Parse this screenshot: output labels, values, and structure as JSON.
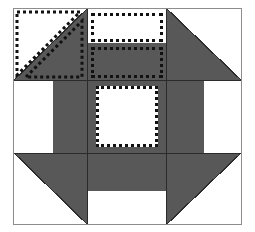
{
  "figure": {
    "canvas": {
      "width": 255,
      "height": 232
    },
    "background_color": "#ffffff"
  },
  "colors": {
    "fabric_dark": "#585858",
    "fabric_light": "#ffffff",
    "seam_line": "#2b2b2b",
    "frame_border": "#8d8d8d",
    "annotation_dotted": "#111111"
  },
  "block": {
    "frame": {
      "x": 13,
      "y": 8,
      "width": 229,
      "height": 217
    },
    "columns": [
      {
        "name": "left",
        "x": 0,
        "width": 73
      },
      {
        "name": "center",
        "x": 73,
        "width": 80
      },
      {
        "name": "right",
        "x": 153,
        "width": 74
      }
    ],
    "rows": [
      {
        "name": "top",
        "y": 0,
        "height": 71
      },
      {
        "name": "middle",
        "y": 71,
        "height": 73
      },
      {
        "name": "bottom",
        "y": 144,
        "height": 71
      }
    ]
  },
  "patches": [
    {
      "id": "top-left",
      "label": "Half-square triangle, light upper-left / dark lower-right",
      "shape": "half-square-triangle",
      "orientation": "tl-light",
      "x": 0,
      "y": 0,
      "width": 73,
      "height": 71
    },
    {
      "id": "top-center",
      "label": "Split rectangle, light top / dark bottom",
      "shape": "split-rectangle",
      "x": 73,
      "y": 0,
      "width": 80,
      "height": 71,
      "split_y": 34,
      "top_fill": "light",
      "bottom_fill": "dark"
    },
    {
      "id": "top-right",
      "label": "Half-square triangle, dark lower-left / light upper-right",
      "shape": "half-square-triangle",
      "orientation": "tr-light",
      "x": 153,
      "y": 0,
      "width": 74,
      "height": 71
    },
    {
      "id": "middle-left",
      "label": "Rectangle bar, light left / dark right",
      "shape": "split-rectangle-vertical",
      "x": 0,
      "y": 71,
      "width": 73,
      "height": 73,
      "split_x": 39,
      "left_fill": "light",
      "right_fill": "dark"
    },
    {
      "id": "center",
      "label": "Center square, light on dark ground",
      "shape": "square-on-ground",
      "x": 73,
      "y": 71,
      "width": 80,
      "height": 73,
      "inner": {
        "x": 9,
        "y": 6,
        "width": 62,
        "height": 61
      },
      "ground_fill": "dark",
      "inner_fill": "light"
    },
    {
      "id": "middle-right",
      "label": "Rectangle bar, dark left / light right",
      "shape": "split-rectangle-vertical",
      "x": 153,
      "y": 71,
      "width": 74,
      "height": 73,
      "split_x": 37,
      "left_fill": "dark",
      "right_fill": "light"
    },
    {
      "id": "bottom-left",
      "label": "Half-square triangle, dark upper-right / light lower-left",
      "shape": "half-square-triangle",
      "orientation": "bl-light",
      "x": 0,
      "y": 144,
      "width": 73,
      "height": 71
    },
    {
      "id": "bottom-center",
      "label": "Split rectangle, dark top / light bottom",
      "shape": "split-rectangle",
      "x": 73,
      "y": 144,
      "width": 80,
      "height": 71,
      "split_y": 38,
      "top_fill": "dark",
      "bottom_fill": "light"
    },
    {
      "id": "bottom-right",
      "label": "Half-square triangle, dark upper-left / light lower-right",
      "shape": "half-square-triangle",
      "orientation": "br-light",
      "x": 153,
      "y": 144,
      "width": 74,
      "height": 71
    }
  ],
  "annotations": [
    {
      "id": "ann-top-left-light-triangle",
      "label": "Dotted outline on light upper-left triangle",
      "style": "dotted",
      "shape": "triangle",
      "points": "3,3 66,3 3,66"
    },
    {
      "id": "ann-top-left-dark-triangle",
      "label": "Dotted outline on dark lower-right triangle",
      "style": "dotted",
      "shape": "triangle",
      "points": "12,68 68,12 68,68"
    },
    {
      "id": "ann-top-center-light",
      "label": "Dotted outline on light top rectangle",
      "style": "dotted",
      "shape": "rect",
      "x": 77,
      "y": 4,
      "width": 72,
      "height": 29
    },
    {
      "id": "ann-top-center-dark",
      "label": "Dotted outline on dark bottom rectangle",
      "style": "dotted",
      "shape": "rect",
      "x": 77,
      "y": 38,
      "width": 72,
      "height": 31
    },
    {
      "id": "ann-center-square",
      "label": "Dotted outline on center light square",
      "style": "dotted",
      "shape": "rect",
      "x": 82,
      "y": 77,
      "width": 62,
      "height": 61
    }
  ]
}
